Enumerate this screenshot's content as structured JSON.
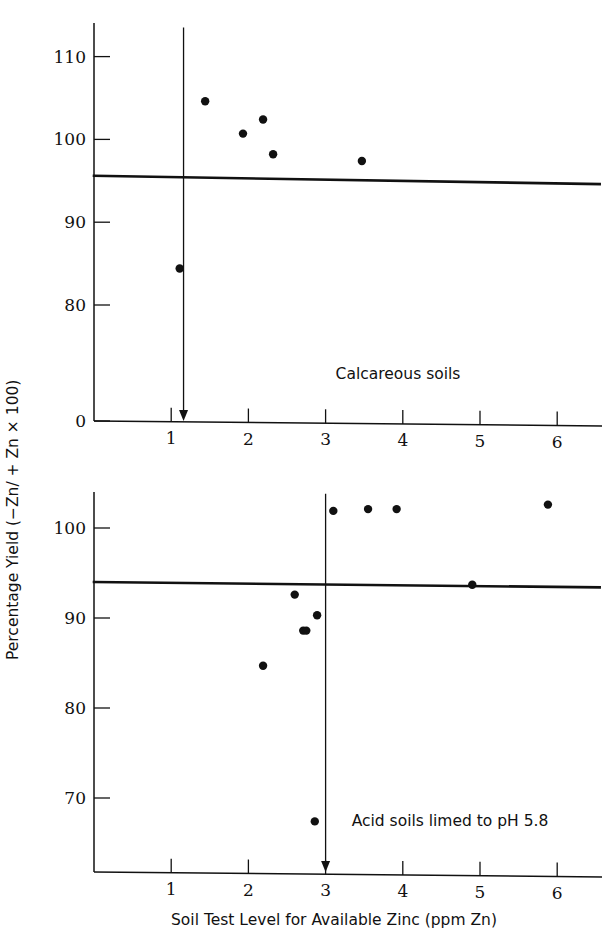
{
  "figure": {
    "xlabel": "Soil Test Level for Available Zinc (ppm Zn)",
    "ylabel": "Percentage Yield (−Zn/ + Zn × 100)",
    "line_color": "#111111",
    "dot_color": "#111111",
    "background": "#ffffff"
  },
  "chart_data": [
    {
      "type": "scatter",
      "panel": "top",
      "title": "",
      "annotation": "Calcareous soils",
      "xlabel": "Soil Test Level for Available Zinc (ppm Zn)",
      "ylabel": "Percentage Yield (−Zn/ + Zn × 100)",
      "xlim": [
        0,
        6.6
      ],
      "ylim": [
        0,
        114
      ],
      "xticks": [
        1,
        2,
        3,
        4,
        5,
        6
      ],
      "xticklabels": [
        "1",
        "2",
        "3",
        "4",
        "5",
        "6"
      ],
      "yticks": [
        0,
        80,
        90,
        100,
        110
      ],
      "yticklabels": [
        "0",
        "80",
        "90",
        "100",
        "110"
      ],
      "y_axis_break": true,
      "grid": false,
      "legend": false,
      "points": [
        {
          "x": 1.11,
          "y": 84.4
        },
        {
          "x": 1.44,
          "y": 104.6
        },
        {
          "x": 1.93,
          "y": 100.7
        },
        {
          "x": 2.19,
          "y": 102.4
        },
        {
          "x": 2.32,
          "y": 98.2
        },
        {
          "x": 3.47,
          "y": 97.4
        }
      ],
      "reference_line": {
        "label": "critical yield level",
        "x_start": 0.0,
        "y_start": 95.6,
        "x_end": 6.55,
        "y_end": 94.6
      },
      "critical_level_arrow": {
        "label": "critical soil test level",
        "x": 1.16,
        "y_top": 113.5,
        "y_bottom": 0
      }
    },
    {
      "type": "scatter",
      "panel": "bottom",
      "title": "",
      "annotation": "Acid soils limed to pH 5.8",
      "xlabel": "Soil Test Level for Available Zinc (ppm Zn)",
      "ylabel": "Percentage Yield (−Zn/ + Zn × 100)",
      "xlim": [
        0,
        6.6
      ],
      "ylim": [
        64,
        104
      ],
      "xticks": [
        1,
        2,
        3,
        4,
        5,
        6
      ],
      "xticklabels": [
        "1",
        "2",
        "3",
        "4",
        "5",
        "6"
      ],
      "yticks": [
        70,
        80,
        90,
        100
      ],
      "yticklabels": [
        "70",
        "80",
        "90",
        "100"
      ],
      "grid": false,
      "legend": false,
      "points": [
        {
          "x": 2.19,
          "y": 84.7
        },
        {
          "x": 2.6,
          "y": 92.6
        },
        {
          "x": 2.71,
          "y": 88.6
        },
        {
          "x": 2.89,
          "y": 90.3
        },
        {
          "x": 2.75,
          "y": 88.6
        },
        {
          "x": 2.86,
          "y": 67.4
        },
        {
          "x": 3.1,
          "y": 101.9
        },
        {
          "x": 3.55,
          "y": 102.1
        },
        {
          "x": 3.92,
          "y": 102.1
        },
        {
          "x": 4.9,
          "y": 93.7
        },
        {
          "x": 5.88,
          "y": 102.6
        }
      ],
      "reference_line": {
        "label": "critical yield level",
        "x_start": 0.0,
        "y_start": 94.0,
        "x_end": 6.55,
        "y_end": 93.4
      },
      "critical_level_arrow": {
        "label": "critical soil test level",
        "x": 3.0,
        "y_top": 103.8,
        "y_bottom": 64.0
      }
    }
  ]
}
